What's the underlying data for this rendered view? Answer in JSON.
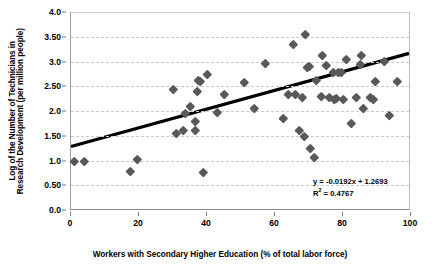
{
  "chart_data": {
    "type": "scatter",
    "title": "",
    "xlabel": "Workers with Secondary Higher Education (% of total labor force)",
    "ylabel_line1": "Log of the Number of Technicians in",
    "ylabel_line2": "Research Development (per million people)",
    "xlim": [
      0,
      100
    ],
    "ylim": [
      0.0,
      4.0
    ],
    "xticks": [
      0,
      20,
      40,
      60,
      80,
      100
    ],
    "xtick_labels": [
      "0",
      "20",
      "40",
      "60",
      "80",
      "100"
    ],
    "yticks": [
      0.0,
      0.5,
      1.0,
      1.5,
      2.0,
      2.5,
      3.0,
      3.5,
      4.0
    ],
    "ytick_labels": [
      "0.0",
      "0.50",
      "1.0",
      "1.50",
      "2.0",
      "2.50",
      "3.0",
      "3.50",
      "4.0"
    ],
    "grid": "horizontal-dashed",
    "legend": "none",
    "marker": "diamond",
    "marker_color": "#595959",
    "trendline_color": "#000000",
    "annotations": [
      "y = -0.0192x + 1.2693",
      "R² = 0.4767"
    ],
    "equation_text": "y = -0.0192x + 1.2693",
    "r_squared_label": "R",
    "r_squared_sup": "2",
    "r_squared_value": " = 0.4767",
    "trendline": {
      "x0": 0,
      "y0": 1.27,
      "x1": 100,
      "y1": 3.16
    },
    "points": [
      {
        "x": 1.0,
        "y": 0.99
      },
      {
        "x": 4.0,
        "y": 0.98
      },
      {
        "x": 17.5,
        "y": 0.79
      },
      {
        "x": 19.5,
        "y": 1.02
      },
      {
        "x": 30.0,
        "y": 2.43
      },
      {
        "x": 31.0,
        "y": 1.54
      },
      {
        "x": 33.0,
        "y": 1.61
      },
      {
        "x": 33.5,
        "y": 1.95
      },
      {
        "x": 35.0,
        "y": 2.09
      },
      {
        "x": 36.5,
        "y": 1.79
      },
      {
        "x": 36.5,
        "y": 1.61
      },
      {
        "x": 37.0,
        "y": 2.39
      },
      {
        "x": 37.5,
        "y": 2.62
      },
      {
        "x": 38.0,
        "y": 2.59
      },
      {
        "x": 39.0,
        "y": 0.76
      },
      {
        "x": 40.0,
        "y": 2.75
      },
      {
        "x": 43.0,
        "y": 1.98
      },
      {
        "x": 45.0,
        "y": 2.34
      },
      {
        "x": 51.0,
        "y": 2.58
      },
      {
        "x": 54.0,
        "y": 2.06
      },
      {
        "x": 57.0,
        "y": 2.97
      },
      {
        "x": 62.5,
        "y": 1.86
      },
      {
        "x": 64.0,
        "y": 2.33
      },
      {
        "x": 65.5,
        "y": 3.34
      },
      {
        "x": 66.0,
        "y": 2.33
      },
      {
        "x": 67.0,
        "y": 1.62
      },
      {
        "x": 68.0,
        "y": 2.27
      },
      {
        "x": 68.5,
        "y": 1.48
      },
      {
        "x": 69.0,
        "y": 3.55
      },
      {
        "x": 69.5,
        "y": 2.88
      },
      {
        "x": 70.0,
        "y": 2.9
      },
      {
        "x": 70.5,
        "y": 1.24
      },
      {
        "x": 71.5,
        "y": 1.06
      },
      {
        "x": 72.0,
        "y": 2.62
      },
      {
        "x": 73.5,
        "y": 2.3
      },
      {
        "x": 74.0,
        "y": 3.12
      },
      {
        "x": 75.0,
        "y": 2.93
      },
      {
        "x": 76.0,
        "y": 2.28
      },
      {
        "x": 77.0,
        "y": 2.78
      },
      {
        "x": 77.5,
        "y": 2.24
      },
      {
        "x": 78.0,
        "y": 2.25
      },
      {
        "x": 78.5,
        "y": 2.79
      },
      {
        "x": 79.5,
        "y": 2.78
      },
      {
        "x": 80.0,
        "y": 2.23
      },
      {
        "x": 81.0,
        "y": 3.05
      },
      {
        "x": 82.5,
        "y": 1.76
      },
      {
        "x": 84.0,
        "y": 2.28
      },
      {
        "x": 85.0,
        "y": 2.95
      },
      {
        "x": 85.5,
        "y": 3.13
      },
      {
        "x": 86.0,
        "y": 2.05
      },
      {
        "x": 88.0,
        "y": 2.27
      },
      {
        "x": 89.0,
        "y": 2.24
      },
      {
        "x": 89.5,
        "y": 2.6
      },
      {
        "x": 92.0,
        "y": 3.01
      },
      {
        "x": 93.5,
        "y": 1.92
      },
      {
        "x": 96.0,
        "y": 2.6
      }
    ]
  }
}
